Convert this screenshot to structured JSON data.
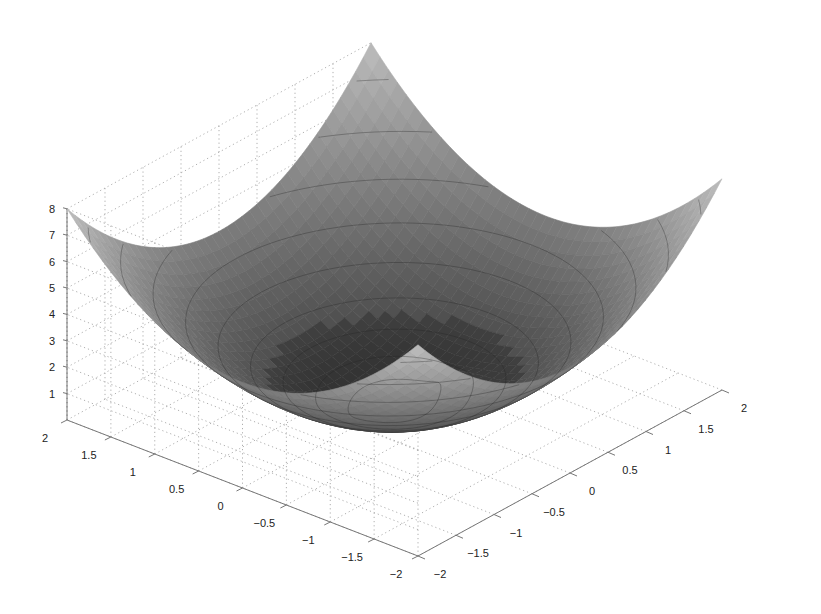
{
  "chart_data": {
    "type": "surface3d",
    "title": "",
    "xlabel": "",
    "ylabel": "",
    "zlabel": "",
    "colormap": "gray",
    "function": "z = x^2 + y^2 with small bump/dip near origin",
    "x_range": [
      -2,
      2
    ],
    "y_range": [
      -2,
      2
    ],
    "zlim": [
      0,
      8
    ],
    "x_ticks": [
      "-2",
      "-1.5",
      "-1",
      "-0.5",
      "0",
      "0.5",
      "1",
      "1.5",
      "2"
    ],
    "y_ticks": [
      "2",
      "1.5",
      "1",
      "0.5",
      "0",
      "-0.5",
      "-1",
      "-1.5",
      "-2"
    ],
    "z_ticks": [
      "1",
      "2",
      "3",
      "4",
      "5",
      "6",
      "7",
      "8"
    ],
    "grid": true,
    "contour_lines": true,
    "corner_values": {
      "(2,2)": 8,
      "(-2,2)": 8,
      "(2,-2)": 8,
      "(-2,-2)": 8
    },
    "min_value": 0
  },
  "colors": {
    "surface_light": "#bdbdbd",
    "surface_dark": "#2e2e2e",
    "grid": "#9a9a9a",
    "axis": "#777777",
    "text": "#222222"
  }
}
